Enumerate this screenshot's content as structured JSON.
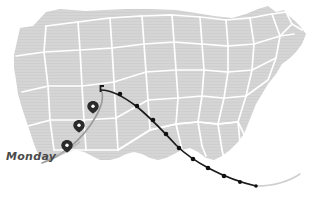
{
  "map": {
    "region": "United States",
    "land_fill": "#d5d5d5",
    "border_color": "#ffffff",
    "background": "#ffffff"
  },
  "annotation": {
    "day_label": "Monday",
    "label_color": "#4a4a4a",
    "leader_color": "#b5b5b5"
  },
  "storm_track": {
    "line_color": "#1b1b1b",
    "point_color": "#111111",
    "forecast_color": "#cfcfcf",
    "origin_marker": "storm-origin-tick",
    "points": [
      {
        "x": 101,
        "y": 90
      },
      {
        "x": 120,
        "y": 94
      },
      {
        "x": 137,
        "y": 106
      },
      {
        "x": 153,
        "y": 120
      },
      {
        "x": 166,
        "y": 134
      },
      {
        "x": 179,
        "y": 148
      },
      {
        "x": 193,
        "y": 159
      },
      {
        "x": 208,
        "y": 168
      },
      {
        "x": 224,
        "y": 176
      },
      {
        "x": 240,
        "y": 182
      },
      {
        "x": 256,
        "y": 186
      }
    ]
  },
  "pin_markers": {
    "color": "#2a2a2a",
    "items": [
      {
        "name": "pin-marker-1",
        "x": 93,
        "y": 107
      },
      {
        "name": "pin-marker-2",
        "x": 79,
        "y": 126
      },
      {
        "name": "pin-marker-3",
        "x": 67,
        "y": 146
      }
    ]
  },
  "secondary_path": {
    "color": "#9a9a9a",
    "name": "gray-front-curve"
  }
}
